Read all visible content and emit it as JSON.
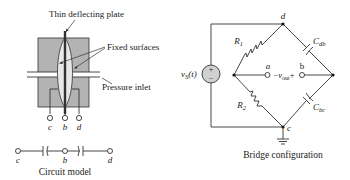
{
  "sensor": {
    "label_plate": "Thin deflecting plate",
    "label_fixed": "Fixed surfaces",
    "label_inlet": "Pressure inlet",
    "terminals": [
      "c",
      "b",
      "d"
    ],
    "body_color": "#b3b3b3"
  },
  "circuit_model": {
    "terminals": [
      "c",
      "b",
      "d"
    ],
    "caption": "Circuit model"
  },
  "bridge": {
    "source_label": "v",
    "source_sub": "S",
    "source_arg": "(t)",
    "source_plus": "+",
    "source_minus": "−",
    "node_top": "d",
    "node_bottom": "c",
    "r1": "R",
    "r1_sub": "1",
    "r2": "R",
    "r2_sub": "2",
    "c_db": "C",
    "c_db_sub": "db",
    "c_bc": "C",
    "c_bc_sub": "bc",
    "out_a": "a",
    "out_b": "b",
    "vout_minus": "−",
    "vout": "v",
    "vout_sub": "out",
    "vout_plus": "+",
    "caption": "Bridge configuration"
  }
}
